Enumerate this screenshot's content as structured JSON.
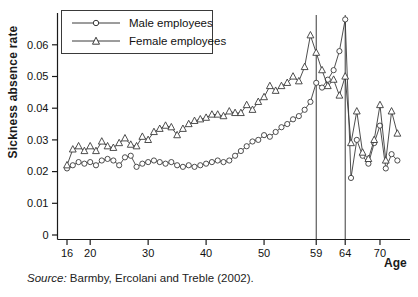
{
  "figure": {
    "source": {
      "prefix": "Source:",
      "text": " Barmby, Ercolani and Treble (2002)."
    }
  },
  "chart_data": {
    "type": "line",
    "title": "",
    "xlabel": "Age",
    "ylabel": "Sickness absence rate",
    "xlim": [
      14.5,
      75
    ],
    "ylim": [
      0,
      0.07
    ],
    "grid": false,
    "legend_position": "top-left-inside",
    "x_ticks": [
      {
        "v": 16,
        "label": "16"
      },
      {
        "v": 20,
        "label": "20"
      },
      {
        "v": 30,
        "label": "30"
      },
      {
        "v": 40,
        "label": "40"
      },
      {
        "v": 50,
        "label": "50"
      },
      {
        "v": 59,
        "label": "59"
      },
      {
        "v": 64,
        "label": "64"
      },
      {
        "v": 70,
        "label": "70"
      }
    ],
    "y_ticks": [
      {
        "v": 0.0,
        "label": "0"
      },
      {
        "v": 0.01,
        "label": "0.01"
      },
      {
        "v": 0.02,
        "label": "0.02"
      },
      {
        "v": 0.03,
        "label": "0.03"
      },
      {
        "v": 0.04,
        "label": "0.04"
      },
      {
        "v": 0.05,
        "label": "0.05"
      },
      {
        "v": 0.06,
        "label": "0.06"
      }
    ],
    "reference_lines_x": [
      59,
      64
    ],
    "x": [
      16,
      17,
      18,
      19,
      20,
      21,
      22,
      23,
      24,
      25,
      26,
      27,
      28,
      29,
      30,
      31,
      32,
      33,
      34,
      35,
      36,
      37,
      38,
      39,
      40,
      41,
      42,
      43,
      44,
      45,
      46,
      47,
      48,
      49,
      50,
      51,
      52,
      53,
      54,
      55,
      56,
      57,
      58,
      59,
      60,
      61,
      62,
      63,
      64,
      65,
      66,
      67,
      68,
      69,
      70,
      71,
      72,
      73
    ],
    "series": [
      {
        "name": "Male employees",
        "marker": "circle",
        "values": [
          0.021,
          0.022,
          0.023,
          0.0225,
          0.023,
          0.022,
          0.0235,
          0.024,
          0.0235,
          0.022,
          0.0245,
          0.025,
          0.0215,
          0.0225,
          0.023,
          0.0235,
          0.023,
          0.0225,
          0.023,
          0.022,
          0.0215,
          0.022,
          0.0215,
          0.022,
          0.0225,
          0.023,
          0.0235,
          0.023,
          0.0235,
          0.025,
          0.0265,
          0.028,
          0.0295,
          0.03,
          0.0315,
          0.031,
          0.0325,
          0.034,
          0.035,
          0.0365,
          0.0375,
          0.0395,
          0.042,
          0.048,
          0.0465,
          0.049,
          0.052,
          0.058,
          0.068,
          0.018,
          0.03,
          0.025,
          0.0225,
          0.029,
          0.0345,
          0.021,
          0.0255,
          0.0235
        ]
      },
      {
        "name": "Female employees",
        "marker": "triangle",
        "values": [
          0.022,
          0.027,
          0.028,
          0.0265,
          0.028,
          0.0265,
          0.0295,
          0.028,
          0.0275,
          0.029,
          0.0305,
          0.0285,
          0.028,
          0.031,
          0.03,
          0.0325,
          0.0335,
          0.0345,
          0.034,
          0.0315,
          0.0335,
          0.035,
          0.036,
          0.0365,
          0.037,
          0.038,
          0.038,
          0.0375,
          0.039,
          0.0385,
          0.0385,
          0.041,
          0.0395,
          0.042,
          0.0435,
          0.047,
          0.0455,
          0.047,
          0.048,
          0.05,
          0.0485,
          0.053,
          0.063,
          0.0575,
          0.052,
          0.047,
          0.049,
          0.044,
          0.05,
          0.029,
          0.039,
          0.026,
          0.024,
          0.03,
          0.041,
          0.0235,
          0.039,
          0.032
        ]
      }
    ],
    "colors": {
      "line": "#3a3a3a",
      "marker_fill": "#ffffff",
      "axis": "#1a1a1a",
      "text": "#111111",
      "background": "#ffffff"
    }
  }
}
